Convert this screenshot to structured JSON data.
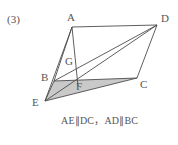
{
  "problem": {
    "number_label": "(3)",
    "caption": "AE∥DC，AD∥BC"
  },
  "figure": {
    "stroke_color": "#4d4d4d",
    "shade_color": "#c9c9c9",
    "background_color": "#ffffff",
    "vertices": [
      {
        "name": "A",
        "label": "A",
        "x": 72,
        "y": 27,
        "label_x": 67,
        "label_y": 12
      },
      {
        "name": "D",
        "label": "D",
        "x": 157,
        "y": 25,
        "label_x": 161,
        "label_y": 13
      },
      {
        "name": "B",
        "label": "B",
        "x": 54,
        "y": 81,
        "label_x": 41,
        "label_y": 72
      },
      {
        "name": "C",
        "label": "C",
        "x": 137,
        "y": 78,
        "label_x": 140,
        "label_y": 79
      },
      {
        "name": "E",
        "label": "E",
        "x": 45,
        "y": 101,
        "label_x": 32,
        "label_y": 97
      },
      {
        "name": "F",
        "label": "F",
        "x": 78,
        "y": 86,
        "label_x": 76,
        "label_y": 81
      },
      {
        "name": "G",
        "label": "G",
        "x": 74,
        "y": 71,
        "label_x": 65,
        "label_y": 56
      }
    ],
    "segments": [
      {
        "name": "segment-AD",
        "from": "A",
        "to": "D"
      },
      {
        "name": "segment-AB",
        "from": "A",
        "to": "B"
      },
      {
        "name": "segment-AE",
        "from": "A",
        "to": "E"
      },
      {
        "name": "segment-AF",
        "from": "A",
        "to": "F"
      },
      {
        "name": "segment-BC",
        "from": "B",
        "to": "C"
      },
      {
        "name": "segment-BD",
        "from": "B",
        "to": "D"
      },
      {
        "name": "segment-BE",
        "from": "B",
        "to": "E"
      },
      {
        "name": "segment-ED",
        "from": "E",
        "to": "D"
      },
      {
        "name": "segment-EC",
        "from": "E",
        "to": "C"
      },
      {
        "name": "segment-DC",
        "from": "D",
        "to": "C"
      }
    ],
    "shaded_region": {
      "name": "shaded-triangle-EBC",
      "points": "45,101 54,81 137,78"
    }
  }
}
